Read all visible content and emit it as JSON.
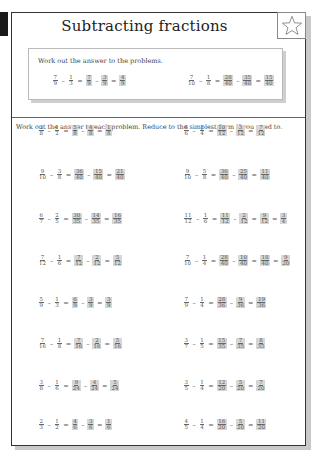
{
  "worksheet": {
    "title": "Subtracting fractions",
    "star_icon": "star-outline-icon",
    "example": {
      "instruction": "Work out the answer to the problems.",
      "problems": [
        {
          "a": [
            "7",
            "9"
          ],
          "b": [
            "1",
            "3"
          ],
          "steps": [
            [
              "7",
              "9"
            ],
            [
              "3",
              "9"
            ]
          ],
          "result": [
            [
              "4",
              "9"
            ]
          ]
        },
        {
          "a": [
            "7",
            "10"
          ],
          "b": [
            "1",
            "8"
          ],
          "steps": [
            [
              "28",
              "40"
            ],
            [
              "35",
              "40"
            ]
          ],
          "result": [
            [
              "15",
              "40"
            ]
          ]
        }
      ]
    },
    "instruction": "Work out the answer to each problem. Reduce to the simplest form if you need to.",
    "problems": [
      {
        "a": [
          "3",
          "8"
        ],
        "b": [
          "1",
          "2"
        ],
        "steps": [
          [
            "5",
            "8"
          ],
          [
            "4",
            "8"
          ]
        ],
        "result": [
          [
            "1",
            "8"
          ]
        ]
      },
      {
        "a": [
          "5",
          "6"
        ],
        "b": [
          "1",
          "4"
        ],
        "steps": [
          [
            "10",
            "12"
          ],
          [
            "3",
            "12"
          ]
        ],
        "result": [
          [
            "7",
            "12"
          ]
        ]
      },
      {
        "a": [
          "9",
          "10"
        ],
        "b": [
          "3",
          "8"
        ],
        "steps": [
          [
            "36",
            "40"
          ],
          [
            "15",
            "40"
          ]
        ],
        "result": [
          [
            "21",
            "40"
          ]
        ]
      },
      {
        "a": [
          "9",
          "10"
        ],
        "b": [
          "5",
          "8"
        ],
        "steps": [
          [
            "36",
            "40"
          ],
          [
            "25",
            "40"
          ]
        ],
        "result": [
          [
            "11",
            "40"
          ]
        ]
      },
      {
        "a": [
          "6",
          "7"
        ],
        "b": [
          "2",
          "5"
        ],
        "steps": [
          [
            "30",
            "35"
          ],
          [
            "14",
            "35"
          ]
        ],
        "result": [
          [
            "16",
            "35"
          ]
        ]
      },
      {
        "a": [
          "11",
          "12"
        ],
        "b": [
          "1",
          "6"
        ],
        "steps": [
          [
            "11",
            "12"
          ],
          [
            "2",
            "12"
          ]
        ],
        "result": [
          [
            "9",
            "12"
          ],
          [
            "3",
            "4"
          ]
        ]
      },
      {
        "a": [
          "7",
          "12"
        ],
        "b": [
          "1",
          "6"
        ],
        "steps": [
          [
            "7",
            "12"
          ],
          [
            "2",
            "12"
          ]
        ],
        "result": [
          [
            "5",
            "12"
          ]
        ]
      },
      {
        "a": [
          "7",
          "10"
        ],
        "b": [
          "1",
          "4"
        ],
        "steps": [
          [
            "28",
            "40"
          ],
          [
            "10",
            "40"
          ]
        ],
        "result": [
          [
            "18",
            "40"
          ],
          [
            "9",
            "20"
          ]
        ]
      },
      {
        "a": [
          "5",
          "9"
        ],
        "b": [
          "1",
          "3"
        ],
        "steps": [
          [
            "6",
            "9"
          ],
          [
            "3",
            "9"
          ]
        ],
        "result": [
          [
            "3",
            "9"
          ]
        ]
      },
      {
        "a": [
          "7",
          "9"
        ],
        "b": [
          "1",
          "4"
        ],
        "steps": [
          [
            "28",
            "36"
          ],
          [
            "9",
            "36"
          ]
        ],
        "result": [
          [
            "19",
            "36"
          ]
        ]
      },
      {
        "a": [
          "7",
          "16"
        ],
        "b": [
          "1",
          "8"
        ],
        "steps": [
          [
            "7",
            "16"
          ],
          [
            "2",
            "16"
          ]
        ],
        "result": [
          [
            "5",
            "16"
          ]
        ]
      },
      {
        "a": [
          "3",
          "7"
        ],
        "b": [
          "1",
          "5"
        ],
        "steps": [
          [
            "15",
            "35"
          ],
          [
            "7",
            "35"
          ]
        ],
        "result": [
          [
            "8",
            "35"
          ]
        ]
      },
      {
        "a": [
          "3",
          "8"
        ],
        "b": [
          "1",
          "6"
        ],
        "steps": [
          [
            "9",
            "24"
          ],
          [
            "4",
            "24"
          ]
        ],
        "result": [
          [
            "5",
            "24"
          ]
        ]
      },
      {
        "a": [
          "3",
          "5"
        ],
        "b": [
          "1",
          "4"
        ],
        "steps": [
          [
            "12",
            "20"
          ],
          [
            "5",
            "20"
          ]
        ],
        "result": [
          [
            "7",
            "20"
          ]
        ]
      },
      {
        "a": [
          "2",
          "3"
        ],
        "b": [
          "1",
          "2"
        ],
        "steps": [
          [
            "4",
            "6"
          ],
          [
            "3",
            "6"
          ]
        ],
        "result": [
          [
            "1",
            "6"
          ]
        ]
      },
      {
        "a": [
          "4",
          "5"
        ],
        "b": [
          "1",
          "4"
        ],
        "steps": [
          [
            "16",
            "20"
          ],
          [
            "5",
            "20"
          ]
        ],
        "result": [
          [
            "11",
            "20"
          ]
        ]
      }
    ],
    "operators": {
      "minus": "–",
      "equals": "="
    }
  }
}
